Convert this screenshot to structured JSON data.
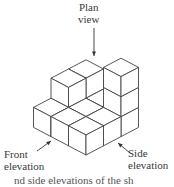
{
  "labels": {
    "plan": [
      "Plan",
      "view"
    ],
    "front": [
      "Front",
      "elevation"
    ],
    "side": [
      "Side",
      "elevation"
    ]
  },
  "caption": "nd side elevations of the sh",
  "colors": {
    "line": "#444444",
    "background": "#ffffff"
  },
  "model": {
    "origin": [
      86,
      155
    ],
    "dx": 17.5,
    "dy": 9.2,
    "h": 20,
    "heights": [
      [
        1,
        1,
        1
      ],
      [
        1,
        1,
        2
      ],
      [
        3,
        1,
        2
      ]
    ]
  }
}
